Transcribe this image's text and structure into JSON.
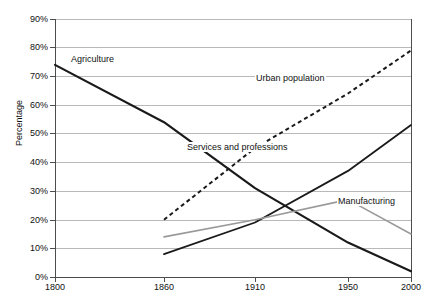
{
  "chart_data": {
    "type": "line",
    "title": "",
    "xlabel": "",
    "ylabel": "Percentage",
    "x": [
      1800,
      1860,
      1910,
      1950,
      2000
    ],
    "categories": [
      "1800",
      "1860",
      "1910",
      "1950",
      "2000"
    ],
    "xtick_labels": [
      "1800",
      "1860",
      "1910",
      "1950",
      "2000"
    ],
    "ytick_labels": [
      "0%",
      "10%",
      "20%",
      "30%",
      "40%",
      "50%",
      "60%",
      "70%",
      "80%",
      "90%"
    ],
    "ytick_values": [
      0,
      10,
      20,
      30,
      40,
      50,
      60,
      70,
      80,
      90
    ],
    "ylim": [
      0,
      90
    ],
    "grid": "horizontal",
    "legend": "inline-labels",
    "series": [
      {
        "name": "Agriculture",
        "style": "solid",
        "color": "#1a1a1a",
        "width": 2.2,
        "x": [
          1800,
          1860,
          1910,
          1950,
          2000
        ],
        "values": [
          74,
          54,
          31,
          12,
          2
        ]
      },
      {
        "name": "Urban population",
        "style": "dashed",
        "color": "#1a1a1a",
        "width": 2.0,
        "x": [
          1860,
          1910,
          1950,
          2000
        ],
        "values": [
          20,
          45,
          64,
          79
        ]
      },
      {
        "name": "Services and professions",
        "style": "solid",
        "color": "#1a1a1a",
        "width": 1.8,
        "x": [
          1860,
          1910,
          1950,
          2000
        ],
        "values": [
          8,
          19,
          37,
          53
        ]
      },
      {
        "name": "Manufacturing",
        "style": "solid",
        "color": "#9a9a9a",
        "width": 1.6,
        "x": [
          1860,
          1910,
          1950,
          2000
        ],
        "values": [
          14,
          20,
          27,
          15
        ]
      }
    ],
    "annotations": [
      {
        "text": "Agriculture",
        "series": "Agriculture"
      },
      {
        "text": "Urban population",
        "series": "Urban population"
      },
      {
        "text": "Services and professions",
        "series": "Services and professions"
      },
      {
        "text": "Manufacturing",
        "series": "Manufacturing"
      }
    ]
  },
  "colors": {
    "background": "#ffffff",
    "axis": "#4d4d4d",
    "grid": "#b9b9b9",
    "text": "#111111",
    "dark_series": "#1a1a1a",
    "gray_series": "#9a9a9a"
  }
}
